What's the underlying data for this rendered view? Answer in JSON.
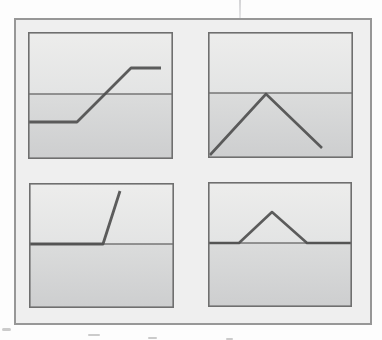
{
  "figure": {
    "colors": {
      "page_bg": "#fdfdfd",
      "frame_fill": "#efefef",
      "frame_border": "#979797",
      "panel_border": "#6f6f6f",
      "panel_upper_top": "#ededec",
      "panel_upper_bottom": "#e3e4e4",
      "panel_lower_top": "#dbdcdc",
      "panel_lower_bottom": "#cdcecf",
      "axis_line": "#767676",
      "curve_line": "#4f4f4f",
      "crease_artifact": "#a0a0a5",
      "speck": "#b9b9b9"
    },
    "panels": [
      {
        "id": "saturating-ramp",
        "position": "top-left",
        "shape": "flat low segment, rising ramp crossing the axis, flat high segment",
        "view": {
          "w": 145,
          "h": 127
        },
        "axis_y": 62,
        "axis_width": 1.4,
        "curve_width": 2.8,
        "curve": [
          [
            0,
            90
          ],
          [
            49,
            90
          ],
          [
            103,
            36
          ],
          [
            133,
            36
          ]
        ]
      },
      {
        "id": "zero-crossing-triangle",
        "position": "top-right",
        "shape": "rises from lower-left corner to a peak touching the axis, then falls toward lower-right",
        "view": {
          "w": 145,
          "h": 126
        },
        "axis_y": 61,
        "axis_width": 1.4,
        "curve_width": 2.6,
        "curve": [
          [
            2,
            123
          ],
          [
            58,
            62
          ],
          [
            114,
            116
          ]
        ]
      },
      {
        "id": "flat-then-steep-rise",
        "position": "bottom-left",
        "shape": "flat segment lying on the axis then a steep rising line",
        "view": {
          "w": 145,
          "h": 125
        },
        "axis_y": 61,
        "axis_width": 1.4,
        "curve_width": 2.8,
        "curve": [
          [
            0,
            61
          ],
          [
            74,
            61
          ],
          [
            91,
            8
          ]
        ]
      },
      {
        "id": "triangle-pulse-on-axis",
        "position": "bottom-right",
        "shape": "flat on axis, small triangular bump above the axis, flat on axis",
        "view": {
          "w": 144,
          "h": 125
        },
        "axis_y": 61,
        "axis_width": 1.4,
        "curve_width": 2.6,
        "curve": [
          [
            0,
            61
          ],
          [
            31,
            61
          ],
          [
            64,
            30
          ],
          [
            99,
            61
          ],
          [
            144,
            61
          ]
        ]
      }
    ]
  }
}
